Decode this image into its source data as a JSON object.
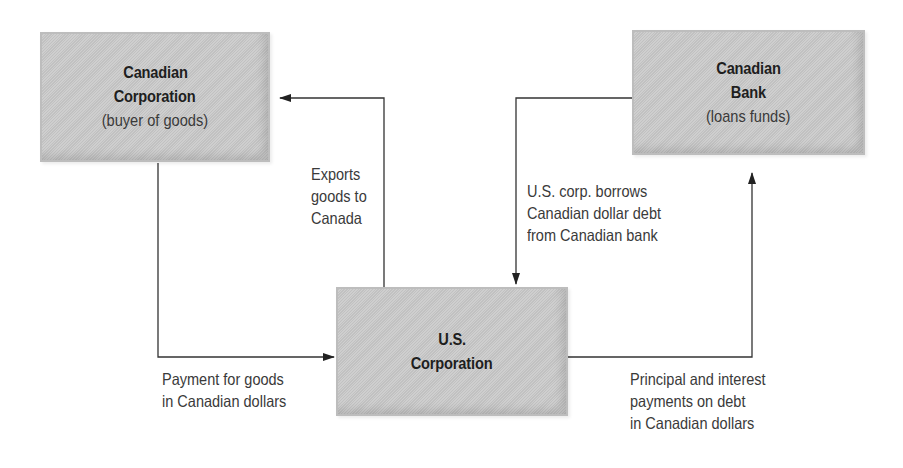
{
  "nodes": {
    "canadian_corporation": {
      "title_line1": "Canadian",
      "title_line2": "Corporation",
      "subtitle": "(buyer of goods)"
    },
    "canadian_bank": {
      "title_line1": "Canadian",
      "title_line2": "Bank",
      "subtitle": "(loans funds)"
    },
    "us_corporation": {
      "title_line1": "U.S.",
      "title_line2": "Corporation"
    }
  },
  "edges": {
    "exports": {
      "from": "U.S. Corporation",
      "to": "Canadian Corporation",
      "lines": [
        "Exports",
        "goods to",
        "Canada"
      ]
    },
    "payment": {
      "from": "Canadian Corporation",
      "to": "U.S. Corporation",
      "lines": [
        "Payment for goods",
        "in Canadian dollars"
      ]
    },
    "borrow": {
      "from": "Canadian Bank",
      "to": "U.S. Corporation",
      "lines": [
        "U.S. corp. borrows",
        "Canadian dollar debt",
        "from Canadian bank"
      ]
    },
    "repay": {
      "from": "U.S. Corporation",
      "to": "Canadian Bank",
      "lines": [
        "Principal and interest",
        "payments on debt",
        "in Canadian dollars"
      ]
    }
  },
  "colors": {
    "box_fill": "#c9c9c9",
    "line": "#333333",
    "text": "#2a2a2a"
  }
}
